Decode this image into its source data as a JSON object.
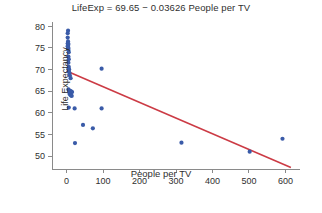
{
  "chart_data": {
    "type": "scatter",
    "title": "LifeExp = 69.65 − 0.03626 People per TV",
    "xlabel": "People per TV",
    "ylabel": "Life Expectancy",
    "xlim": [
      -40,
      640
    ],
    "ylim": [
      47,
      81
    ],
    "xticks": [
      0,
      100,
      200,
      300,
      400,
      500,
      600
    ],
    "yticks": [
      50,
      55,
      60,
      65,
      70,
      75,
      80
    ],
    "grid": false,
    "legend": "none",
    "point_color": "#3a5ba8",
    "line_color": "#cc3b45",
    "axis_color": "#8a8a8a",
    "series": [
      {
        "name": "Countries",
        "type": "scatter",
        "points": [
          [
            4.0,
            79.0
          ],
          [
            3.0,
            78.4
          ],
          [
            3.0,
            77.4
          ],
          [
            4.0,
            76.5
          ],
          [
            3.0,
            76.0
          ],
          [
            5.0,
            75.9
          ],
          [
            4.0,
            75.5
          ],
          [
            3.0,
            75.4
          ],
          [
            5.0,
            75.0
          ],
          [
            4.0,
            74.8
          ],
          [
            5.0,
            74.5
          ],
          [
            6.0,
            74.0
          ],
          [
            5.0,
            73.0
          ],
          [
            6.0,
            72.4
          ],
          [
            5.0,
            71.6
          ],
          [
            6.0,
            70.6
          ],
          [
            5.0,
            70.2
          ],
          [
            7.0,
            70.0
          ],
          [
            6.0,
            69.6
          ],
          [
            8.0,
            69.2
          ],
          [
            9.0,
            68.6
          ],
          [
            11.0,
            68.0
          ],
          [
            96.0,
            70.2
          ],
          [
            5.0,
            65.4
          ],
          [
            7.0,
            65.2
          ],
          [
            9.0,
            65.0
          ],
          [
            11.0,
            65.0
          ],
          [
            13.0,
            64.9
          ],
          [
            15.0,
            64.8
          ],
          [
            8.0,
            64.4
          ],
          [
            10.0,
            64.2
          ],
          [
            12.0,
            64.0
          ],
          [
            14.0,
            63.9
          ],
          [
            6.0,
            61.2
          ],
          [
            22.0,
            61.0
          ],
          [
            96.0,
            61.0
          ],
          [
            45.0,
            57.2
          ],
          [
            72.0,
            56.4
          ],
          [
            23.0,
            53.0
          ],
          [
            315.0,
            53.1
          ],
          [
            502.0,
            51.0
          ],
          [
            592.0,
            54.0
          ]
        ]
      },
      {
        "name": "Least-squares regression line",
        "type": "line",
        "intercept": 69.65,
        "slope": -0.03626,
        "endpoints": [
          [
            0,
            69.65
          ],
          [
            615,
            47.35
          ]
        ]
      }
    ]
  }
}
